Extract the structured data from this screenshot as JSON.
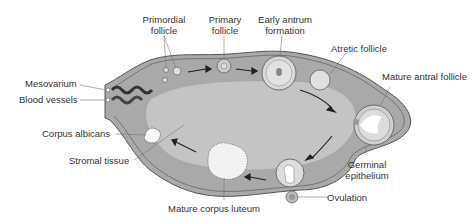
{
  "colors": {
    "ovary_outer": "#a9a9a9",
    "stroma_inner": "#c4c4c4",
    "cortex": "#b3b3b3",
    "outline": "#555555",
    "label_text": "#333333",
    "arrow": "#222222"
  },
  "labels": {
    "primordial_follicle": [
      "Primordial",
      "follicle"
    ],
    "primary_follicle": [
      "Primary",
      "follicle"
    ],
    "early_antrum": [
      "Early antrum",
      "formation"
    ],
    "atretic_follicle": "Atretic follicle",
    "mature_antral_follicle": "Mature antral follicle",
    "mesovarium": "Mesovarium",
    "blood_vessels": "Blood vessels",
    "corpus_albicans": "Corpus albicans",
    "stromal_tissue": "Stromal tissue",
    "germinal_epithelium": [
      "Germinal",
      "epithelium"
    ],
    "ovulation": "Ovulation",
    "mature_corpus_luteum": "Mature corpus luteum"
  }
}
